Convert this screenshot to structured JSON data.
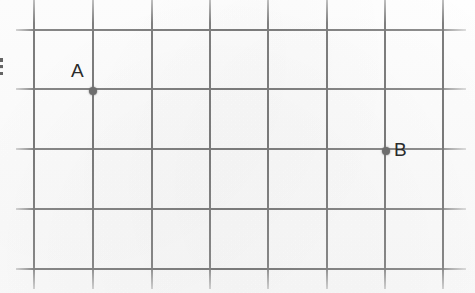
{
  "image": {
    "kind": "scanned-graph-paper-diagram",
    "width": 475,
    "height": 293,
    "background_color": "#fdfdfd",
    "grid_color": "#7a7a7a",
    "point_color": "#6e6e6e",
    "label_color": "#2b2b2b"
  },
  "grid": {
    "vertical_lines_x": [
      34,
      93,
      152,
      210,
      268,
      327,
      385,
      443
    ],
    "horizontal_lines_y": [
      30,
      89,
      149,
      209,
      269
    ],
    "vertical_line_top": 0,
    "vertical_line_bottom": 289,
    "horizontal_line_left": 16,
    "horizontal_line_right": 466,
    "cell_width": 58.5,
    "cell_height": 59.8,
    "line_thickness": 2
  },
  "points": [
    {
      "label": "A",
      "x": 93,
      "y": 91,
      "grid_col_index": 1,
      "grid_row_index": 1,
      "label_x": 71,
      "label_y": 61,
      "dot_diameter": 8
    },
    {
      "label": "B",
      "x": 386,
      "y": 151,
      "grid_col_index": 6,
      "grid_row_index": 2,
      "label_x": 394,
      "label_y": 140,
      "dot_diameter": 8
    }
  ],
  "artifacts": {
    "left_edge_glyph_fragment": {
      "name": "cropped-character-fragment",
      "x": 0,
      "y": 58,
      "width": 3,
      "height": 17
    }
  }
}
